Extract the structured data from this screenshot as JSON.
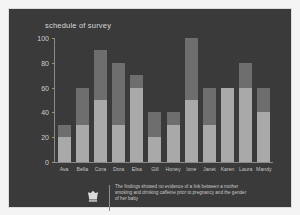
{
  "panel": {
    "background_color": "#3a3a3a",
    "border_color": "#dcdcdc"
  },
  "header": {
    "title": "schedule of survey"
  },
  "caption": {
    "icon": "crown-badge-icon",
    "text": "The findings showed no evidence of a link between a mother smoking and drinking caffeine prior to pregnancy and the gender of her baby"
  },
  "colors": {
    "segment_lower": "#a9a9a9",
    "segment_upper": "#6e6e6e",
    "axis": "#8a8a8a",
    "tick_text": "#cfcfcf",
    "title_text": "#d8d8d8",
    "caption_text": "#c8c8c8"
  },
  "chart_data": {
    "type": "bar",
    "stacked": true,
    "title": "schedule of survey",
    "xlabel": "",
    "ylabel": "",
    "ylim": [
      0,
      100
    ],
    "yticks": [
      0,
      20,
      40,
      60,
      80,
      100
    ],
    "grid": false,
    "legend": "none",
    "categories": [
      "Ava",
      "Bella",
      "Cora",
      "Dora",
      "Elsa",
      "Gill",
      "Honey",
      "Ione",
      "Janet",
      "Karen",
      "Laura",
      "Mandy"
    ],
    "series": [
      {
        "name": "lower",
        "color": "#a9a9a9",
        "values": [
          20,
          30,
          50,
          30,
          60,
          20,
          30,
          50,
          30,
          60,
          60,
          40
        ]
      },
      {
        "name": "upper",
        "color": "#6e6e6e",
        "values": [
          10,
          30,
          40,
          50,
          10,
          20,
          10,
          50,
          30,
          0,
          20,
          20
        ]
      }
    ],
    "totals": [
      30,
      60,
      90,
      80,
      70,
      40,
      40,
      100,
      60,
      60,
      80,
      60
    ]
  }
}
